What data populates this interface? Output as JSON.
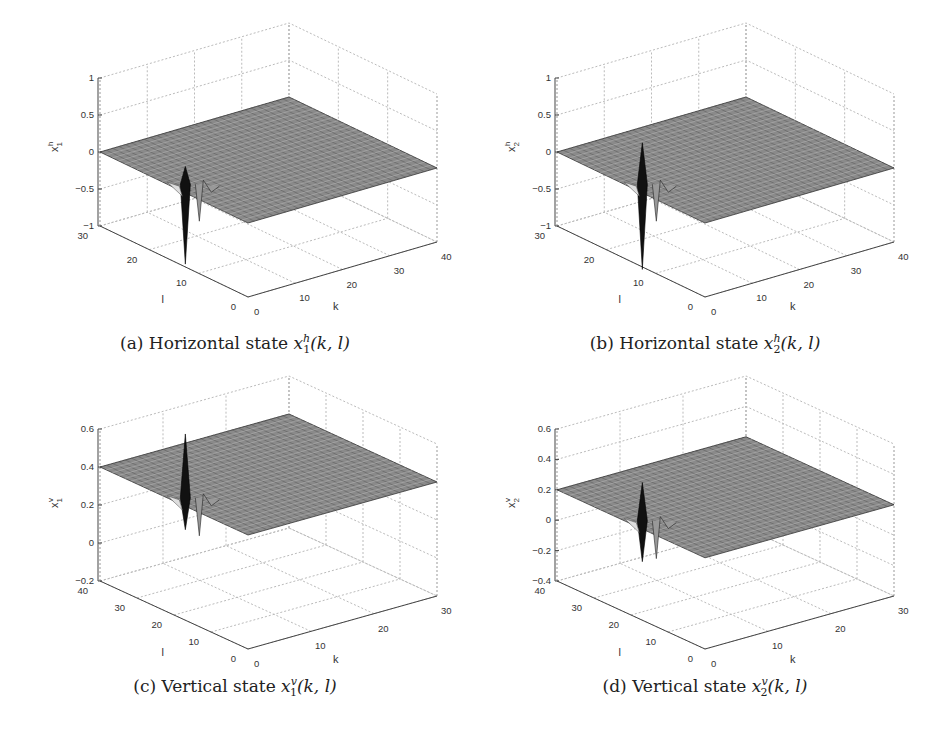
{
  "chart_data": [
    {
      "type": "surface3d",
      "id": "a",
      "caption_prefix": "(a) Horizontal state ",
      "caption_var": "x",
      "caption_sup": "h",
      "caption_sub": "1",
      "caption_args": "(k, l)",
      "xlabel": "k",
      "ylabel": "l",
      "zlabel": "x1h",
      "zlabel_base": "x",
      "zlabel_sup": "h",
      "zlabel_sub": "1",
      "xlim": [
        0,
        40
      ],
      "ylim": [
        0,
        30
      ],
      "zlim": [
        -1,
        1
      ],
      "xticks": [
        "0",
        "10",
        "20",
        "30",
        "40"
      ],
      "yticks": [
        "0",
        "10",
        "20",
        "30"
      ],
      "zticks": [
        "1",
        "0.5",
        "0",
        "-0.5",
        "-1"
      ],
      "grid": true,
      "description": "Flat surface near 0 with a sharp spike near k≈2, l≈0 reaching about -1 and small ripples up to ~0.2 along k"
    },
    {
      "type": "surface3d",
      "id": "b",
      "caption_prefix": "(b) Horizontal state ",
      "caption_var": "x",
      "caption_sup": "h",
      "caption_sub": "2",
      "caption_args": "(k, l)",
      "xlabel": "k",
      "ylabel": "l",
      "zlabel": "x2h",
      "zlabel_base": "x",
      "zlabel_sup": "h",
      "zlabel_sub": "2",
      "xlim": [
        0,
        40
      ],
      "ylim": [
        0,
        30
      ],
      "zlim": [
        -1,
        1
      ],
      "xticks": [
        "0",
        "10",
        "20",
        "30",
        "40"
      ],
      "yticks": [
        "0",
        "10",
        "20",
        "30"
      ],
      "zticks": [
        "1",
        "0.5",
        "0",
        "-0.5",
        "-1"
      ],
      "grid": true,
      "description": "Flat surface near 0 with a sharp spike near k≈2, l≈0 ranging from ~0.3 to ~-1"
    },
    {
      "type": "surface3d",
      "id": "c",
      "caption_prefix": "(c) Vertical state ",
      "caption_var": "x",
      "caption_sup": "v",
      "caption_sub": "1",
      "caption_args": "(k, l)",
      "xlabel": "k",
      "ylabel": "l",
      "zlabel": "x1v",
      "zlabel_base": "x",
      "zlabel_sup": "v",
      "zlabel_sub": "1",
      "xlim": [
        0,
        30
      ],
      "ylim": [
        0,
        40
      ],
      "zlim": [
        -0.2,
        0.6
      ],
      "xticks": [
        "0",
        "10",
        "20",
        "30"
      ],
      "yticks": [
        "0",
        "10",
        "20",
        "30",
        "40"
      ],
      "zticks": [
        "0.6",
        "0.4",
        "0.2",
        "0",
        "-0.2"
      ],
      "grid": true,
      "description": "Flat surface near 0 with spike near k≈1, l≈0 peaking ~0.35 and dipping ~-0.2"
    },
    {
      "type": "surface3d",
      "id": "d",
      "caption_prefix": "(d) Vertical state ",
      "caption_var": "x",
      "caption_sup": "v",
      "caption_sub": "2",
      "caption_args": "(k, l)",
      "xlabel": "k",
      "ylabel": "l",
      "zlabel": "x2v",
      "zlabel_base": "x",
      "zlabel_sup": "v",
      "zlabel_sub": "2",
      "xlim": [
        0,
        30
      ],
      "ylim": [
        0,
        40
      ],
      "zlim": [
        -0.4,
        0.6
      ],
      "xticks": [
        "0",
        "10",
        "20",
        "30"
      ],
      "yticks": [
        "0",
        "10",
        "20",
        "30",
        "40"
      ],
      "zticks": [
        "0.6",
        "0.4",
        "0.2",
        "0",
        "-0.2",
        "-0.4"
      ],
      "grid": true,
      "description": "Flat surface near 0 with spike near k≈1, l≈0 peaking ~0 and dipping ~-0.4"
    }
  ]
}
